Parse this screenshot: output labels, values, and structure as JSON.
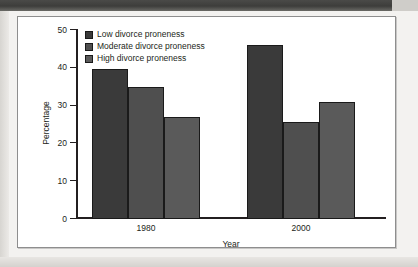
{
  "chart_data": {
    "type": "bar",
    "title": "",
    "xlabel": "Year",
    "ylabel": "Percentage",
    "categories": [
      "1980",
      "2000"
    ],
    "series": [
      {
        "name": "Low divorce proneness",
        "values": [
          39.8,
          46.0
        ],
        "color": "#3a3a3a"
      },
      {
        "name": "Moderate divorce proneness",
        "values": [
          34.8,
          25.7
        ],
        "color": "#4f4f4f"
      },
      {
        "name": "High divorce proneness",
        "values": [
          27.0,
          31.0
        ],
        "color": "#5a5a5a"
      }
    ],
    "ylim": [
      0,
      50
    ],
    "yticks": [
      "0",
      "10",
      "20",
      "30",
      "40",
      "50"
    ],
    "ytick_values": [
      0,
      10,
      20,
      30,
      40,
      50
    ],
    "grid": false,
    "legend_position": "top-left"
  },
  "legend": {
    "items": [
      {
        "label": "Low divorce proneness",
        "color": "#3a3a3a"
      },
      {
        "label": "Moderate divorce proneness",
        "color": "#4f4f4f"
      },
      {
        "label": "High divorce proneness",
        "color": "#5a5a5a"
      }
    ]
  }
}
